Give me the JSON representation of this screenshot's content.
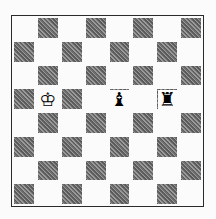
{
  "board": {
    "files": [
      "a",
      "b",
      "c",
      "d",
      "e",
      "f",
      "g",
      "h"
    ],
    "ranks": [
      8,
      7,
      6,
      5,
      4,
      3,
      2,
      1
    ],
    "light_color": "#fbfbfb",
    "dark_color": "#7a7a7a",
    "pieces": [
      {
        "square": "b5",
        "piece": "king",
        "color": "white",
        "glyph": "♔"
      },
      {
        "square": "e5",
        "piece": "bishop",
        "color": "black",
        "glyph": "♝"
      },
      {
        "square": "g5",
        "piece": "rook",
        "color": "black",
        "glyph": "♜"
      }
    ]
  }
}
